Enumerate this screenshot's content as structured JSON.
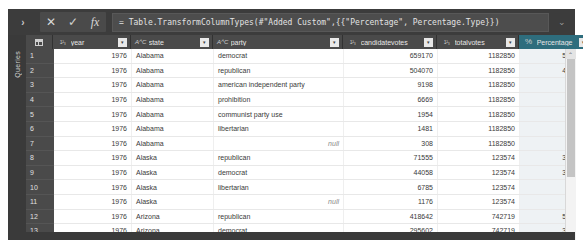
{
  "window": {
    "title": "Power Query Editor",
    "queries_pane_label": "Queries"
  },
  "formula_bar": {
    "expand_icon": "chevron-right",
    "cancel_label": "✕",
    "confirm_label": "✓",
    "fx_label": "fx",
    "value": "= Table.TransformColumnTypes(#\"Added Custom\",{{\"Percentage\", Percentage.Type}})",
    "placeholder": "Enter formula",
    "collapse_icon": "⌄"
  },
  "grid": {
    "select_all_icon": "table-corner-icon",
    "columns": [
      {
        "name": "year",
        "type_icon": "1²₃",
        "type_class": "num",
        "filter_glyph": "▾",
        "selected": false,
        "align": "num",
        "width": 78
      },
      {
        "name": "state",
        "type_icon": "AᴬC",
        "type_class": "abc",
        "filter_glyph": "▾",
        "selected": false,
        "align": "txt",
        "width": 82
      },
      {
        "name": "party",
        "type_icon": "AᴬC",
        "type_class": "abc",
        "filter_glyph": "▾",
        "selected": false,
        "align": "txt",
        "width": 130
      },
      {
        "name": "candidatevotes",
        "type_icon": "1²₃",
        "type_class": "num",
        "filter_glyph": "▾",
        "selected": false,
        "align": "num",
        "width": 94
      },
      {
        "name": "totalvotes",
        "type_icon": "1²₃",
        "type_class": "num",
        "filter_glyph": "▾",
        "selected": false,
        "align": "num",
        "width": 82
      },
      {
        "name": "Percentage",
        "type_icon": "%",
        "type_class": "pct",
        "filter_glyph": "▾",
        "selected": true,
        "align": "pct",
        "width": 73
      }
    ],
    "rows": [
      {
        "n": "1",
        "year": "1976",
        "state": "Alabama",
        "party": "democrat",
        "candidatevotes": "659170",
        "totalvotes": "1182850",
        "percentage": "55.73 %"
      },
      {
        "n": "2",
        "year": "1976",
        "state": "Alabama",
        "party": "republican",
        "candidatevotes": "504070",
        "totalvotes": "1182850",
        "percentage": "42.61 %"
      },
      {
        "n": "3",
        "year": "1976",
        "state": "Alabama",
        "party": "american independent party",
        "candidatevotes": "9198",
        "totalvotes": "1182850",
        "percentage": "0.78 %"
      },
      {
        "n": "4",
        "year": "1976",
        "state": "Alabama",
        "party": "prohibition",
        "candidatevotes": "6669",
        "totalvotes": "1182850",
        "percentage": "0.56 %"
      },
      {
        "n": "5",
        "year": "1976",
        "state": "Alabama",
        "party": "communist party use",
        "candidatevotes": "1954",
        "totalvotes": "1182850",
        "percentage": "0.17 %"
      },
      {
        "n": "6",
        "year": "1976",
        "state": "Alabama",
        "party": "libertarian",
        "candidatevotes": "1481",
        "totalvotes": "1182850",
        "percentage": "0.13 %"
      },
      {
        "n": "7",
        "year": "1976",
        "state": "Alabama",
        "party": "null",
        "candidatevotes": "308",
        "totalvotes": "1182850",
        "percentage": "0.03 %"
      },
      {
        "n": "8",
        "year": "1976",
        "state": "Alaska",
        "party": "republican",
        "candidatevotes": "71555",
        "totalvotes": "123574",
        "percentage": "37.90 %"
      },
      {
        "n": "9",
        "year": "1976",
        "state": "Alaska",
        "party": "democrat",
        "candidatevotes": "44058",
        "totalvotes": "123574",
        "percentage": "35.65 %"
      },
      {
        "n": "10",
        "year": "1976",
        "state": "Alaska",
        "party": "libertarian",
        "candidatevotes": "6785",
        "totalvotes": "123574",
        "percentage": "5.49 %"
      },
      {
        "n": "11",
        "year": "1976",
        "state": "Alaska",
        "party": "null",
        "candidatevotes": "1176",
        "totalvotes": "123574",
        "percentage": "0.95 %"
      },
      {
        "n": "12",
        "year": "1976",
        "state": "Arizona",
        "party": "republican",
        "candidatevotes": "418642",
        "totalvotes": "742719",
        "percentage": "56.37 %"
      },
      {
        "n": "13",
        "year": "1976",
        "state": "Arizona",
        "party": "democrat",
        "candidatevotes": "295602",
        "totalvotes": "742719",
        "percentage": "39.80 %"
      }
    ],
    "null_token": "null"
  },
  "scrollbar": {
    "up_arrow": "⌃",
    "name": "vertical-scrollbar"
  },
  "colors": {
    "chrome_dark": "#3a3a3a",
    "header_dark": "#4a4a4a",
    "selected_column": "#2e6d7d",
    "grid_bg": "#ffffff",
    "pct_column_bg": "#eef2f4"
  }
}
